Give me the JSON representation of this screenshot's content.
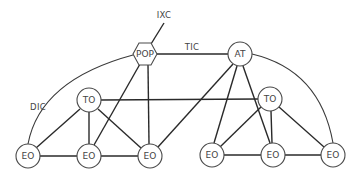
{
  "diagram": {
    "nodes": {
      "pop": {
        "label": "POP",
        "shape": "hexagon"
      },
      "at": {
        "label": "AT",
        "shape": "circle"
      },
      "to_left": {
        "label": "TO",
        "shape": "circle"
      },
      "to_right": {
        "label": "TO",
        "shape": "circle"
      },
      "eo_1": {
        "label": "EO",
        "shape": "circle"
      },
      "eo_2": {
        "label": "EO",
        "shape": "circle"
      },
      "eo_3": {
        "label": "EO",
        "shape": "circle"
      },
      "eo_4": {
        "label": "EO",
        "shape": "circle"
      },
      "eo_5": {
        "label": "EO",
        "shape": "circle"
      },
      "eo_6": {
        "label": "EO",
        "shape": "circle"
      }
    },
    "edge_labels": {
      "ixc": "IXC",
      "tic": "TIC",
      "dic": "DIC"
    },
    "edges": [
      [
        "pop",
        "ixc"
      ],
      [
        "pop",
        "at"
      ],
      [
        "pop",
        "eo_2"
      ],
      [
        "pop",
        "eo_3"
      ],
      [
        "at",
        "eo_3"
      ],
      [
        "at",
        "eo_4"
      ],
      [
        "at",
        "eo_5"
      ],
      [
        "to_left",
        "to_right"
      ],
      [
        "to_left",
        "eo_1"
      ],
      [
        "to_left",
        "eo_2"
      ],
      [
        "to_left",
        "eo_3"
      ],
      [
        "to_right",
        "eo_4"
      ],
      [
        "to_right",
        "eo_5"
      ],
      [
        "to_right",
        "eo_6"
      ],
      [
        "eo_1",
        "eo_2"
      ],
      [
        "eo_2",
        "eo_3"
      ],
      [
        "eo_4",
        "eo_5"
      ],
      [
        "eo_5",
        "eo_6"
      ],
      [
        "eo_1",
        "pop",
        "arc"
      ],
      [
        "at",
        "eo_6",
        "arc"
      ]
    ]
  }
}
